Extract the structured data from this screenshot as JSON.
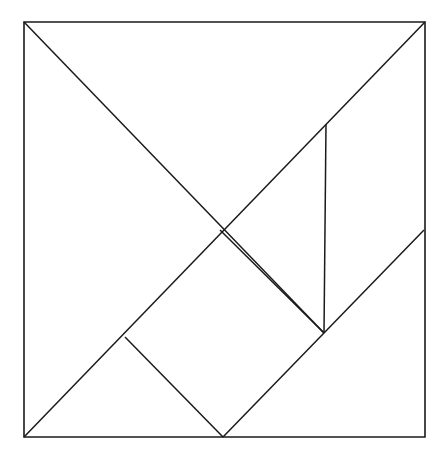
{
  "figure": {
    "kind": "tangram-dissection-diagram",
    "background_color": "#ffffff",
    "line_color": "#1a1a1a",
    "line_width_px": 1.5,
    "canvas": {
      "width": 445,
      "height": 460
    }
  },
  "square": {
    "label": "outer-square",
    "top_left": {
      "x": 24,
      "y": 22
    },
    "top_right": {
      "x": 425,
      "y": 22
    },
    "bottom_right": {
      "x": 425,
      "y": 437
    },
    "bottom_left": {
      "x": 24,
      "y": 437
    },
    "width_px": 401,
    "height_px": 415
  },
  "vertices": {
    "A_top_left": {
      "x": 24,
      "y": 22
    },
    "B_top_right": {
      "x": 425,
      "y": 22
    },
    "C_bottom_right": {
      "x": 425,
      "y": 437
    },
    "D_bottom_left": {
      "x": 24,
      "y": 437
    },
    "E_center_cross": {
      "x": 220,
      "y": 230
    },
    "F_vertical_top": {
      "x": 326,
      "y": 124
    },
    "G_vertical_bottom": {
      "x": 324,
      "y": 333
    },
    "H_left_notch": {
      "x": 125,
      "y": 337
    },
    "I_bottom_middle": {
      "x": 223,
      "y": 437
    },
    "J_right_edge": {
      "x": 424,
      "y": 230
    }
  },
  "lines": [
    {
      "name": "square-top-edge",
      "from": {
        "x": 24,
        "y": 22
      },
      "to": {
        "x": 425,
        "y": 22
      },
      "role": "outline"
    },
    {
      "name": "square-right-edge",
      "from": {
        "x": 425,
        "y": 22
      },
      "to": {
        "x": 425,
        "y": 437
      },
      "role": "outline"
    },
    {
      "name": "square-bottom-edge",
      "from": {
        "x": 425,
        "y": 437
      },
      "to": {
        "x": 24,
        "y": 437
      },
      "role": "outline"
    },
    {
      "name": "square-left-edge",
      "from": {
        "x": 24,
        "y": 437
      },
      "to": {
        "x": 24,
        "y": 22
      },
      "role": "outline"
    },
    {
      "name": "main-diagonal-topleft-to-center-right",
      "from": {
        "x": 24,
        "y": 22
      },
      "to": {
        "x": 324,
        "y": 333
      },
      "role": "cut"
    },
    {
      "name": "anti-diagonal-bottomleft-to-topright",
      "from": {
        "x": 24,
        "y": 437
      },
      "to": {
        "x": 425,
        "y": 22
      },
      "role": "cut"
    },
    {
      "name": "vertical-cut-right",
      "from": {
        "x": 326,
        "y": 124
      },
      "to": {
        "x": 324,
        "y": 333
      },
      "role": "cut"
    },
    {
      "name": "cut-center-to-lower-right",
      "from": {
        "x": 220,
        "y": 230
      },
      "to": {
        "x": 324,
        "y": 333
      },
      "role": "cut"
    },
    {
      "name": "cut-left-notch-to-bottom-middle",
      "from": {
        "x": 125,
        "y": 337
      },
      "to": {
        "x": 223,
        "y": 437
      },
      "role": "cut"
    },
    {
      "name": "cut-bottom-middle-to-right-edge",
      "from": {
        "x": 223,
        "y": 437
      },
      "to": {
        "x": 424,
        "y": 230
      },
      "role": "cut"
    }
  ],
  "pieces": [
    {
      "name": "large-triangle-upper-left",
      "shape": "triangle",
      "points": "24,22 425,22 220,230"
    },
    {
      "name": "large-triangle-lower-left",
      "shape": "triangle",
      "points": "24,22 220,230 125,337 24,437"
    },
    {
      "name": "medium-triangle-bottom",
      "shape": "triangle",
      "points": "125,337 223,437 324,333"
    },
    {
      "name": "small-triangle-center",
      "shape": "triangle",
      "points": "220,230 324,333 326,124"
    },
    {
      "name": "parallelogram-right",
      "shape": "parallelogram",
      "points": "326,124 425,22 424,230 324,333"
    },
    {
      "name": "triangle-bottom-right",
      "shape": "triangle",
      "points": "223,437 424,230 425,437"
    }
  ]
}
